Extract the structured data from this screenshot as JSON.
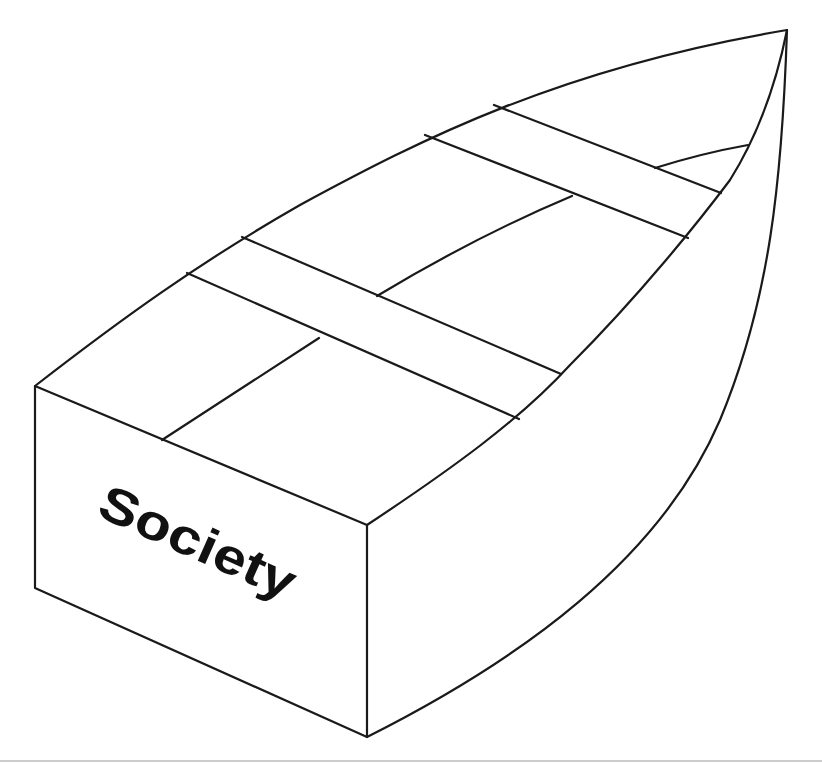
{
  "diagram": {
    "type": "boat-illustration",
    "stern_label": "Society",
    "parts": {
      "stern_box": "stern-box",
      "seats_count": 4,
      "has_keel_line": true,
      "bow_point": "bow-tip"
    },
    "colors": {
      "line": "#1a1a1a",
      "background": "#ffffff",
      "separator": "#9a9a9a"
    }
  }
}
